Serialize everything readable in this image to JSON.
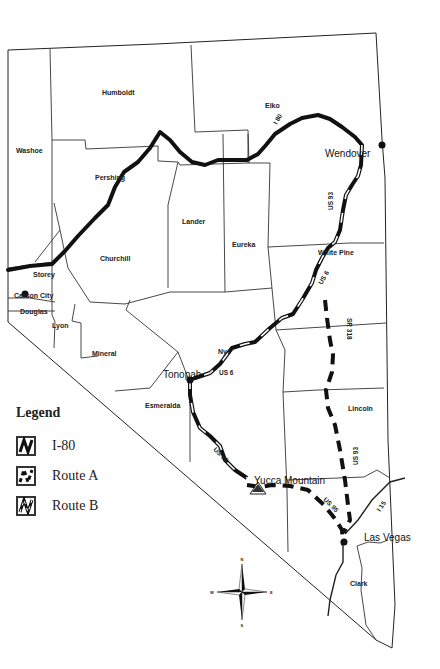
{
  "map": {
    "state": "Nevada",
    "counties": [
      {
        "name": "Humboldt",
        "x": 102,
        "y": 95
      },
      {
        "name": "Elko",
        "x": 265,
        "y": 108
      },
      {
        "name": "Washoe",
        "x": 16,
        "y": 153
      },
      {
        "name": "Pershing",
        "x": 95,
        "y": 180
      },
      {
        "name": "Lander",
        "x": 182,
        "y": 224
      },
      {
        "name": "Eureka",
        "x": 232,
        "y": 247
      },
      {
        "name": "White Pine",
        "x": 318,
        "y": 255
      },
      {
        "name": "Churchill",
        "x": 100,
        "y": 261
      },
      {
        "name": "Storey",
        "x": 33,
        "y": 277
      },
      {
        "name": "Carson City",
        "x": 14,
        "y": 298
      },
      {
        "name": "Douglas",
        "x": 20,
        "y": 314
      },
      {
        "name": "Lyon",
        "x": 52,
        "y": 328
      },
      {
        "name": "Mineral",
        "x": 92,
        "y": 356
      },
      {
        "name": "Nye",
        "x": 218,
        "y": 354
      },
      {
        "name": "Esmeralda",
        "x": 145,
        "y": 408
      },
      {
        "name": "Lincoln",
        "x": 348,
        "y": 411
      },
      {
        "name": "Clark",
        "x": 350,
        "y": 586
      }
    ],
    "cities": [
      {
        "name": "Wendover",
        "x": 325,
        "y": 157
      },
      {
        "name": "Tonopah",
        "x": 163,
        "y": 378
      },
      {
        "name": "Yucca Mountain",
        "x": 254,
        "y": 484
      },
      {
        "name": "Las Vegas",
        "x": 364,
        "y": 541
      }
    ],
    "road_labels": [
      {
        "text": "I 80",
        "x": 277,
        "y": 125,
        "rotate": -60
      },
      {
        "text": "US 93",
        "x": 333,
        "y": 210,
        "rotate": -90
      },
      {
        "text": "US 6",
        "x": 322,
        "y": 285,
        "rotate": -60
      },
      {
        "text": "US 6",
        "x": 219,
        "y": 375,
        "rotate": 0
      },
      {
        "text": "SR 318",
        "x": 347,
        "y": 318,
        "rotate": 90
      },
      {
        "text": "US 95",
        "x": 213,
        "y": 450,
        "rotate": 45
      },
      {
        "text": "US 93",
        "x": 358,
        "y": 465,
        "rotate": -90
      },
      {
        "text": "US 95",
        "x": 323,
        "y": 500,
        "rotate": 45
      },
      {
        "text": "I 15",
        "x": 380,
        "y": 512,
        "rotate": -55
      }
    ],
    "compass": {
      "n": "N",
      "s": "S",
      "e": "E",
      "w": "W"
    }
  },
  "legend": {
    "title": "Legend",
    "items": [
      {
        "label": "I-80",
        "style": "solid"
      },
      {
        "label": "Route A",
        "style": "dashed"
      },
      {
        "label": "Route B",
        "style": "cased"
      }
    ]
  }
}
